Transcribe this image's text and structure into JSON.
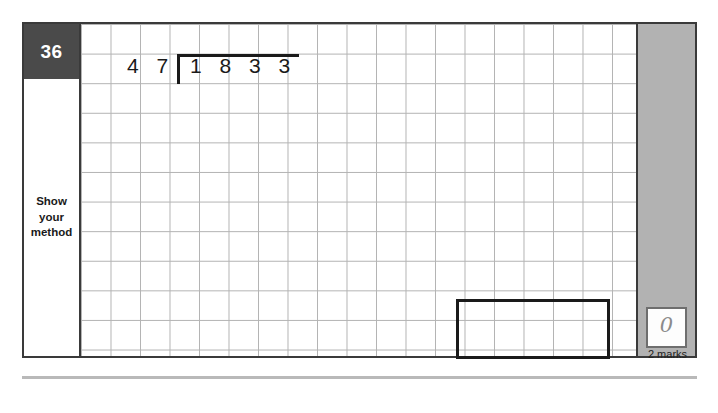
{
  "page": {
    "question_number": "36",
    "method_label": "Show\nyour\nmethod",
    "colors": {
      "question_tab_bg": "#4a4a4a",
      "marks_column_bg": "#b2b2b2",
      "frame_border": "#3a3a3a",
      "grid_line": "#9a9a9a",
      "ink": "#1a1a1a",
      "handwriting": "#8b8b8b"
    }
  },
  "division": {
    "divisor": "47",
    "divisor_digits": [
      "4",
      "7"
    ],
    "dividend": "1833",
    "dividend_digits": [
      "1",
      "8",
      "3",
      "3"
    ],
    "expression": "1833 ÷ 47"
  },
  "answer": {
    "value": ""
  },
  "marks": {
    "awarded": "0",
    "label": "2 marks"
  }
}
